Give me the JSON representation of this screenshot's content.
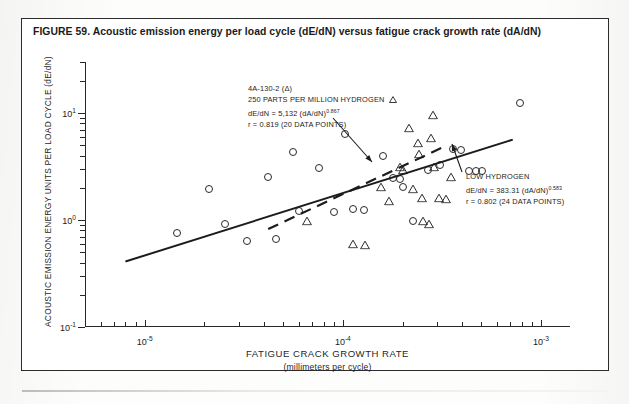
{
  "caption": "FIGURE 59. Acoustic emission energy per load cycle (dE/dN) versus fatigue crack growth rate (dA/dN)",
  "annotations": {
    "high_hydrogen": {
      "specimen": "4A-130-2 (Δ)",
      "condition": "250 PARTS PER MILLION HYDROGEN",
      "equation_prefix": "dE/dN  =  5,132  (dA/dN)",
      "equation_exponent": "0.867",
      "correlation": "r  =  0.819  (20 DATA POINTS)"
    },
    "low_hydrogen": {
      "condition": "LOW HYDROGEN",
      "equation_prefix": "dE/dN  =  383.31  (dA/dN)",
      "equation_exponent": "0.583",
      "correlation": "r  =  0.802  (24 DATA POINTS)"
    }
  },
  "chart_data": {
    "type": "scatter",
    "title": "Acoustic emission energy per load cycle (dE/dN) versus fatigue crack growth rate (dA/dN)",
    "xlabel": "FATIGUE CRACK GROWTH RATE",
    "xlabel_units": "(millimeters per cycle)",
    "ylabel": "ACOUSTIC EMISSION ENERGY UNITS PER LOAD CYCLE (dE/dN)",
    "xscale": "log",
    "yscale": "log",
    "xlim": [
      5e-06,
      0.0014
    ],
    "ylim": [
      0.1,
      30
    ],
    "grid": false,
    "legend_position": "none",
    "xticks": [
      {
        "value": 1e-05,
        "label": "10",
        "exponent": "-5"
      },
      {
        "value": 0.0001,
        "label": "10",
        "exponent": "-4"
      },
      {
        "value": 0.001,
        "label": "10",
        "exponent": "-3"
      }
    ],
    "yticks": [
      {
        "value": 10,
        "label": "10",
        "exponent": "1"
      },
      {
        "value": 1,
        "label": "10",
        "exponent": "0"
      },
      {
        "value": 0.1,
        "label": "10",
        "exponent": "-1"
      }
    ],
    "series": [
      {
        "name": "LOW HYDROGEN",
        "marker": "circle",
        "n_points": 24,
        "points": [
          [
            1.45e-05,
            0.76
          ],
          [
            2.1e-05,
            1.95
          ],
          [
            2.55e-05,
            0.92
          ],
          [
            3.3e-05,
            0.64
          ],
          [
            4.2e-05,
            2.55
          ],
          [
            4.6e-05,
            0.66
          ],
          [
            5.6e-05,
            4.35
          ],
          [
            6e-05,
            1.22
          ],
          [
            7.6e-05,
            3.05
          ],
          [
            9e-05,
            1.18
          ],
          [
            0.000102,
            6.4
          ],
          [
            0.000112,
            1.28
          ],
          [
            0.000128,
            1.24
          ],
          [
            0.00016,
            3.95
          ],
          [
            0.00018,
            2.45
          ],
          [
            0.000195,
            2.4
          ],
          [
            0.0002,
            2.05
          ],
          [
            0.000225,
            0.98
          ],
          [
            0.00027,
            2.95
          ],
          [
            0.00031,
            3.3
          ],
          [
            0.00036,
            4.6
          ],
          [
            0.000435,
            2.85
          ],
          [
            0.00047,
            2.85
          ],
          [
            0.000505,
            2.85
          ]
        ]
      },
      {
        "name": "250 PARTS PER MILLION HYDROGEN",
        "marker": "triangle",
        "n_points": 20,
        "points": [
          [
            6.6e-05,
            0.98
          ],
          [
            0.000112,
            0.6
          ],
          [
            0.00013,
            0.58
          ],
          [
            0.000155,
            2.05
          ],
          [
            0.00017,
            1.52
          ],
          [
            0.000195,
            3.1
          ],
          [
            0.0002,
            2.95
          ],
          [
            0.000215,
            7.2
          ],
          [
            0.000225,
            1.95
          ],
          [
            0.00024,
            5.3
          ],
          [
            0.000242,
            4.1
          ],
          [
            0.00025,
            1.6
          ],
          [
            0.000255,
            0.98
          ],
          [
            0.000272,
            0.92
          ],
          [
            0.00028,
            5.85
          ],
          [
            0.000285,
            9.5
          ],
          [
            0.00029,
            3.1
          ],
          [
            0.000305,
            1.62
          ],
          [
            0.00033,
            1.58
          ],
          [
            0.00035,
            2.55
          ]
        ]
      },
      {
        "name": "Extra circles (upper right)",
        "marker": "circle",
        "n_points": 2,
        "points": [
          [
            0.00078,
            12.5
          ],
          [
            0.000395,
            4.55
          ]
        ]
      }
    ],
    "fit_lines": [
      {
        "name": "LOW HYDROGEN fit",
        "style": "solid",
        "equation": "dE/dN = 383.31 (dA/dN)^0.583",
        "r": 0.802,
        "x_start": 8e-06,
        "x_end": 0.00072
      },
      {
        "name": "250 PPM HYDROGEN fit",
        "style": "dashed",
        "equation": "dE/dN = 5132 (dA/dN)^0.867",
        "r": 0.819,
        "x_start": 4.2e-05,
        "x_end": 0.00032
      }
    ]
  }
}
